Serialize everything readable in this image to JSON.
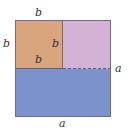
{
  "diagram": {
    "regions": [
      {
        "name": "square-b",
        "color": "#d9a57d"
      },
      {
        "name": "rect-top-right",
        "color": "#d3b2d6"
      },
      {
        "name": "rect-bottom",
        "color": "#7c92cc"
      }
    ],
    "labels": {
      "top": "b",
      "left": "b",
      "inner_right": "b",
      "inner_bottom": "b",
      "right": "a",
      "bottom": "a"
    }
  }
}
